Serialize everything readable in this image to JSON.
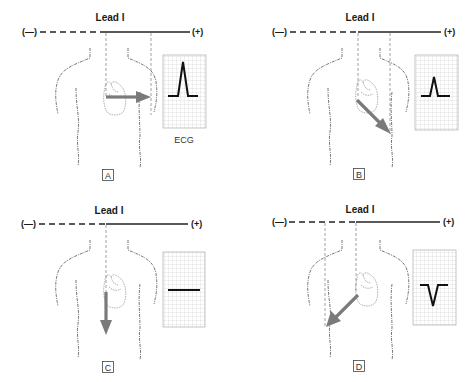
{
  "figure": {
    "lead_name": "Lead I",
    "negative_pole": "(—)",
    "positive_pole": "(+)",
    "ecg_caption": "ECG",
    "colors": {
      "vector_arrow": "#7a7a7a",
      "lead_line": "#222222",
      "ecg_trace": "#111111",
      "grid": "#bdbdbd"
    }
  },
  "panels": [
    {
      "label": "A",
      "vector_direction": "horizontal-left-to-right",
      "ecg_deflection": "tall-positive",
      "show_ecg_caption": true
    },
    {
      "label": "B",
      "vector_direction": "down-right-diagonal",
      "ecg_deflection": "small-positive",
      "show_ecg_caption": false
    },
    {
      "label": "C",
      "vector_direction": "straight-down",
      "ecg_deflection": "flat-isoelectric",
      "show_ecg_caption": false
    },
    {
      "label": "D",
      "vector_direction": "down-left-diagonal",
      "ecg_deflection": "negative",
      "show_ecg_caption": false
    }
  ]
}
